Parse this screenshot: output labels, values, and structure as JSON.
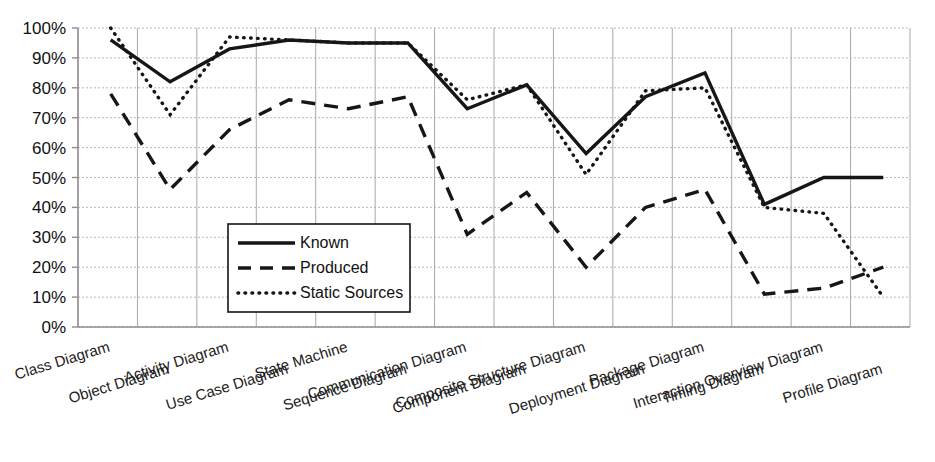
{
  "chart_data": {
    "type": "line",
    "title": "",
    "subtitle": "",
    "xlabel": "",
    "ylabel": "",
    "ylim": [
      0,
      100
    ],
    "y_unit": "%",
    "grid": true,
    "legend_position": "inside-center-left",
    "categories": [
      "Class Diagram",
      "Object Diagram",
      "Activity Diagram",
      "Use Case Diagram",
      "State Machine",
      "Sequence Diagram",
      "Communication Diagram",
      "Component Diagram",
      "Composite Structure Diagram",
      "Deployment Diagram",
      "Package Diagram",
      "Timing Diagram",
      "Interaction Overview Diagram",
      "Profile Diagram"
    ],
    "ytick_labels": [
      "100%",
      "90%",
      "80%",
      "70%",
      "60%",
      "50%",
      "40%",
      "30%",
      "20%",
      "10%",
      "0%"
    ],
    "ytick_values": [
      100,
      90,
      80,
      70,
      60,
      50,
      40,
      30,
      20,
      10,
      0
    ],
    "series": [
      {
        "name": "Known",
        "style": "solid",
        "values": [
          96,
          82,
          93,
          96,
          95,
          95,
          73,
          81,
          58,
          77,
          85,
          41,
          50,
          50
        ]
      },
      {
        "name": "Produced",
        "style": "dashed",
        "values": [
          78,
          46,
          66,
          76,
          73,
          77,
          31,
          45,
          20,
          40,
          46,
          11,
          13,
          20
        ]
      },
      {
        "name": "Static Sources",
        "style": "dotted",
        "values": [
          100,
          71,
          97,
          96,
          95,
          95,
          76,
          81,
          51,
          79,
          80,
          40,
          38,
          10
        ]
      }
    ]
  },
  "legend": {
    "entries": [
      {
        "label": "Known",
        "style": "solid"
      },
      {
        "label": "Produced",
        "style": "dashed"
      },
      {
        "label": "Static Sources",
        "style": "dotted"
      }
    ]
  }
}
